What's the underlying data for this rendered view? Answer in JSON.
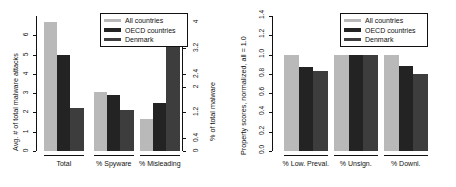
{
  "figure": {
    "background": "#ffffff",
    "colors": {
      "all_countries": "#b9b9b9",
      "oecd_countries": "#232323",
      "denmark": "#3d3d3d",
      "axis": "#111111"
    }
  },
  "legend": {
    "position": "top-right",
    "entries": [
      {
        "label": "All countries",
        "color": "#b9b9b9"
      },
      {
        "label": "OECD countries",
        "color": "#232323"
      },
      {
        "label": "Denmark",
        "color": "#3d3d3d"
      }
    ]
  },
  "chart_data": [
    {
      "type": "bar",
      "id": "left",
      "title": "",
      "xlabel": "",
      "ylabel": "Avg. # of total malware attacks",
      "y2label": "% of total malware",
      "categories": [
        "Total",
        "% Spyware",
        "% Misleading"
      ],
      "series": [
        {
          "name": "All countries",
          "color": "#b9b9b9",
          "values": [
            6.7,
            1.85,
            1.0
          ]
        },
        {
          "name": "OECD countries",
          "color": "#232323",
          "values": [
            5.0,
            1.75,
            1.5
          ]
        },
        {
          "name": "Denmark",
          "color": "#3d3d3d",
          "values": [
            2.25,
            1.28,
            3.35
          ]
        }
      ],
      "ylim": [
        0,
        7
      ],
      "yticks": [
        0,
        1,
        2,
        3,
        4,
        5,
        6
      ],
      "yticklabels": [
        "0",
        "1",
        "2",
        "3",
        "4",
        "5",
        "6"
      ],
      "y2lim": [
        0,
        4.2
      ],
      "y2ticks": [
        0,
        0.4,
        1.2,
        2,
        2.4,
        3.2,
        4
      ],
      "y2ticklabels": [
        "0",
        "0.4",
        "1.2",
        "2",
        "2.4",
        "3.2",
        "4"
      ],
      "grid": false,
      "legend": "top-right",
      "note": "Total group read on left axis; percentage groups read on right axis"
    },
    {
      "type": "bar",
      "id": "right",
      "title": "",
      "xlabel": "",
      "ylabel": "Property scores, normalized, all = 1.0",
      "categories": [
        "% Low. Preval.",
        "% Unsign.",
        "% Downl."
      ],
      "series": [
        {
          "name": "All countries",
          "color": "#b9b9b9",
          "values": [
            1.0,
            1.0,
            1.0
          ]
        },
        {
          "name": "OECD countries",
          "color": "#232323",
          "values": [
            0.87,
            1.0,
            0.88
          ]
        },
        {
          "name": "Denmark",
          "color": "#3d3d3d",
          "values": [
            0.83,
            1.0,
            0.8
          ]
        }
      ],
      "ylim": [
        0,
        1.4
      ],
      "yticks": [
        0.0,
        0.2,
        0.4,
        0.6,
        0.8,
        1.0,
        1.2,
        1.4
      ],
      "yticklabels": [
        "0.0",
        "0.2",
        "0.4",
        "0.6",
        "0.8",
        "1.0",
        "1.2",
        "1.4"
      ],
      "grid": false,
      "legend": "top-right"
    }
  ]
}
